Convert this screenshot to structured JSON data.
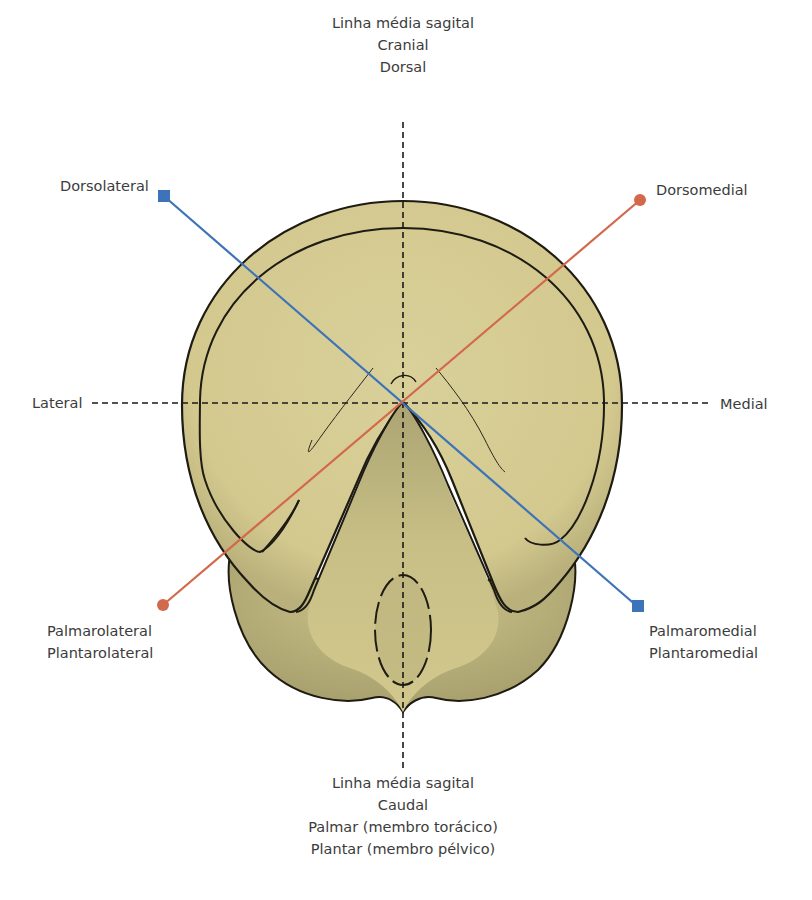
{
  "figure": {
    "type": "anatomical-orientation-diagram"
  },
  "labels": {
    "top": {
      "lines": [
        "Linha média sagital",
        "Cranial",
        "Dorsal"
      ]
    },
    "bottom": {
      "lines": [
        "Linha média sagital",
        "Caudal",
        "Palmar (membro torácico)",
        "Plantar (membro pélvico)"
      ]
    },
    "lateral": "Lateral",
    "medial": "Medial",
    "dorsolateral": "Dorsolateral",
    "dorsomedial": "Dorsomedial",
    "palmarolateral": {
      "lines": [
        "Palmarolateral",
        "Plantarolateral"
      ]
    },
    "palmaromedial": {
      "lines": [
        "Palmaromedial",
        "Plantaromedial"
      ]
    }
  },
  "axes": [
    {
      "name": "sagittal-midline",
      "style": "dashed",
      "color": "#1a1a1a"
    },
    {
      "name": "transverse-line",
      "style": "dashed",
      "color": "#1a1a1a"
    },
    {
      "name": "dorsolateral-palmaromedial",
      "style": "solid",
      "color": "#3d73b8",
      "marker": "square"
    },
    {
      "name": "dorsomedial-palmarolateral",
      "style": "solid",
      "color": "#d2694a",
      "marker": "circle"
    }
  ],
  "colors": {
    "hoof_fill": "#d6cc94",
    "hoof_shadow": "#a9a271",
    "outline": "#1e1b12",
    "blue_line": "#3d73b8",
    "orange_line": "#d2694a"
  }
}
